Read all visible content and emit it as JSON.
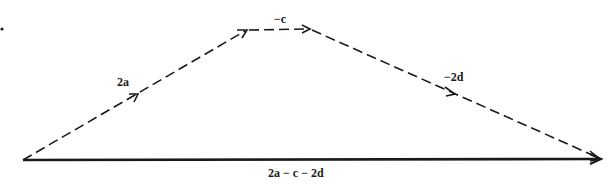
{
  "diagram": {
    "type": "vector-addition",
    "stroke_color": "#1a1a1a",
    "background": "#ffffff",
    "points": {
      "origin": [
        23,
        160
      ],
      "after_2a": [
        247,
        30
      ],
      "after_minus_c": [
        310,
        29
      ],
      "end": [
        601,
        159
      ]
    },
    "vectors": [
      {
        "id": "v2a",
        "label": "2a",
        "style": "dashed",
        "from": "origin",
        "to": "after_2a",
        "label_pos": [
          124,
          86
        ],
        "mid_arrow": [
          137,
          95
        ]
      },
      {
        "id": "vminusc",
        "label": "−c",
        "style": "dashed",
        "from": "after_2a",
        "to": "after_minus_c",
        "label_pos": [
          282,
          22
        ]
      },
      {
        "id": "vminus2d",
        "label": "−2d",
        "style": "dashed",
        "from": "after_minus_c",
        "to": "end",
        "label_pos": [
          456,
          80
        ],
        "mid_arrow": [
          453,
          93
        ]
      },
      {
        "id": "vresult",
        "label": "2a − c − 2d",
        "style": "solid",
        "from": "origin",
        "to": "end",
        "label_pos": [
          304,
          177
        ]
      }
    ],
    "marker_dot": [
      2,
      29
    ]
  }
}
